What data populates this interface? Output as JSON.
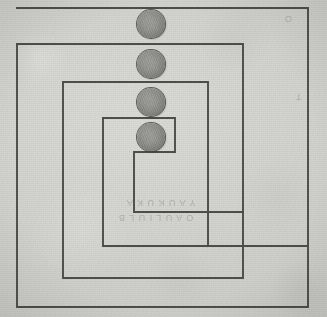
{
  "figure": {
    "medium": "pencil on gray paper (scanned)",
    "background_color": "#d6d6d4",
    "ink_color": "#3a3a38",
    "coin_color": "#8a8a87",
    "width": 327,
    "height": 317
  },
  "chart_data": {
    "type": "line",
    "xlabel": "",
    "ylabel": "",
    "xlim": [
      0,
      327
    ],
    "ylim": [
      0,
      317
    ],
    "grid": false,
    "legend": "none",
    "series": [
      {
        "name": "outer-spiral-arm",
        "points": [
          [
            17,
            8
          ],
          [
            308,
            8
          ],
          [
            308,
            307
          ],
          [
            17,
            307
          ],
          [
            17,
            44
          ]
        ]
      },
      {
        "name": "second-spiral-arm",
        "points": [
          [
            17,
            44
          ],
          [
            243,
            44
          ],
          [
            243,
            278
          ],
          [
            63,
            278
          ],
          [
            63,
            82
          ]
        ]
      },
      {
        "name": "third-spiral-arm",
        "points": [
          [
            63,
            82
          ],
          [
            208,
            82
          ],
          [
            208,
            246
          ],
          [
            103,
            246
          ],
          [
            103,
            118
          ]
        ]
      },
      {
        "name": "inner-spiral-arm",
        "points": [
          [
            103,
            118
          ],
          [
            175,
            118
          ],
          [
            175,
            152
          ],
          [
            134,
            152
          ],
          [
            134,
            212
          ],
          [
            243,
            212
          ]
        ]
      },
      {
        "name": "outer-bottom-return",
        "points": [
          [
            103,
            246
          ],
          [
            308,
            246
          ]
        ]
      }
    ]
  },
  "coins": {
    "label": "gray disks placed along the vertical center axis",
    "count": 4,
    "diameter": 28,
    "items": [
      {
        "name": "coin-1",
        "cx": 151,
        "cy": 24,
        "r": 14
      },
      {
        "name": "coin-2",
        "cx": 151,
        "cy": 64,
        "r": 14
      },
      {
        "name": "coin-3",
        "cx": 151,
        "cy": 102,
        "r": 14
      },
      {
        "name": "coin-4",
        "cx": 151,
        "cy": 137,
        "r": 14
      }
    ]
  },
  "annotations": {
    "faint_marks": [
      {
        "name": "bleed-through-top-right",
        "text": "O",
        "x": 288,
        "y": 18
      },
      {
        "name": "bleed-through-mid-right",
        "text": "T",
        "x": 298,
        "y": 96
      },
      {
        "name": "bleed-through-center",
        "text": "Y  A  U  K  U  K  A",
        "x": 126,
        "y": 203
      },
      {
        "name": "bleed-through-lower-left",
        "text": "O  A  U  L  I  U  L  B",
        "x": 120,
        "y": 218
      }
    ]
  }
}
